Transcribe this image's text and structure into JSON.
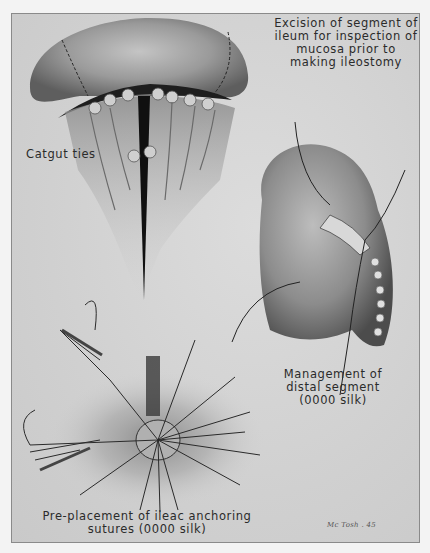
{
  "figure": {
    "type": "medical-illustration",
    "style": "grayscale halftone plate",
    "colors": {
      "margin": "#f3f3f3",
      "plate": "#d2d2d2",
      "border": "#8a8a8a",
      "ink": "#2b2b2b",
      "tissue_dark": "#3a3a3a",
      "tissue_light": "#b8b8b8"
    }
  },
  "labels": {
    "excision": [
      "Excision of segment of",
      "ileum for inspection of",
      "mucosa prior to",
      "making ileostomy"
    ],
    "catgut": "Catgut ties",
    "distal": [
      "Management of",
      "distal segment",
      "(0000 silk)"
    ],
    "preplacement": [
      "Pre-placement of ileac anchoring",
      "sutures (0000  silk)"
    ]
  },
  "signature": "Mc Tosh . 45"
}
